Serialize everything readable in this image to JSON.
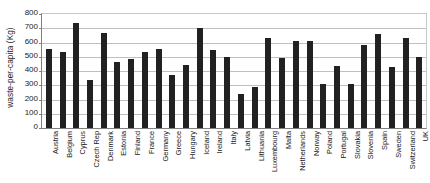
{
  "chart_data": {
    "type": "bar",
    "title": "",
    "xlabel": "",
    "ylabel": "waste-per-capita (Kg)",
    "ylim": [
      0,
      800
    ],
    "ytick_step": 100,
    "yticks": [
      800,
      700,
      600,
      500,
      400,
      300,
      200,
      100,
      0
    ],
    "grid": true,
    "legend": "none",
    "bar_color": "#212121",
    "categories": [
      "Austria",
      "Belgium",
      "Cyprus",
      "Czech Rep",
      "Denmark",
      "Estonia",
      "Finland",
      "France",
      "Germany",
      "Greece",
      "Hungary",
      "Iceland",
      "Ireland",
      "Italy",
      "Latvia",
      "Lithuania",
      "Luxembourg",
      "Malta",
      "Netherlands",
      "Norway",
      "Poland",
      "Portugal",
      "Slovakia",
      "Slovenia",
      "Spain",
      "Sweden",
      "Switzerland",
      "UK"
    ],
    "values": [
      555,
      535,
      740,
      335,
      665,
      460,
      485,
      530,
      555,
      370,
      440,
      705,
      545,
      500,
      240,
      290,
      635,
      490,
      610,
      610,
      310,
      435,
      310,
      580,
      660,
      425,
      635,
      495
    ]
  }
}
